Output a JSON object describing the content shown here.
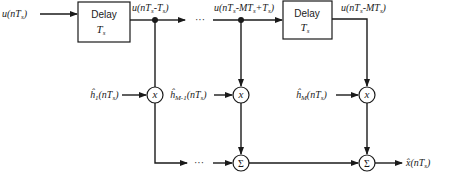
{
  "diagram": {
    "input": {
      "label": "u(nT",
      "sub": "s",
      "close": ")"
    },
    "delay_blocks": [
      {
        "label": "Delay",
        "param": "T",
        "param_sub": "s"
      },
      {
        "label": "Delay",
        "param": "T",
        "param_sub": "s"
      }
    ],
    "taps": [
      {
        "signal": "u(nT",
        "signal_sub1": "s",
        "signal_mid": "-T",
        "signal_sub2": "s",
        "signal_close": ")"
      },
      {
        "signal": "u(nT",
        "signal_sub1": "s",
        "signal_mid": "-MT",
        "signal_sub2": "s",
        "signal_mid2": "+T",
        "signal_sub3": "s",
        "signal_close": ")"
      },
      {
        "signal": "u(nT",
        "signal_sub1": "s",
        "signal_mid": "-MT",
        "signal_sub2": "s",
        "signal_close": ")"
      }
    ],
    "coefficients": [
      {
        "hat": "ĥ",
        "sub": "1",
        "arg": "(nT",
        "arg_sub": "s",
        "close": ")"
      },
      {
        "hat": "ĥ",
        "sub": "M-1",
        "arg": "(nT",
        "arg_sub": "s",
        "close": ")"
      },
      {
        "hat": "ĥ",
        "sub": "M",
        "arg": "(nT",
        "arg_sub": "s",
        "close": ")"
      }
    ],
    "multiplier_symbol": "x",
    "summer_symbol": "Σ",
    "ellipsis": "···",
    "output": {
      "label": "x̂(nT",
      "sub": "s",
      "close": ")"
    }
  }
}
